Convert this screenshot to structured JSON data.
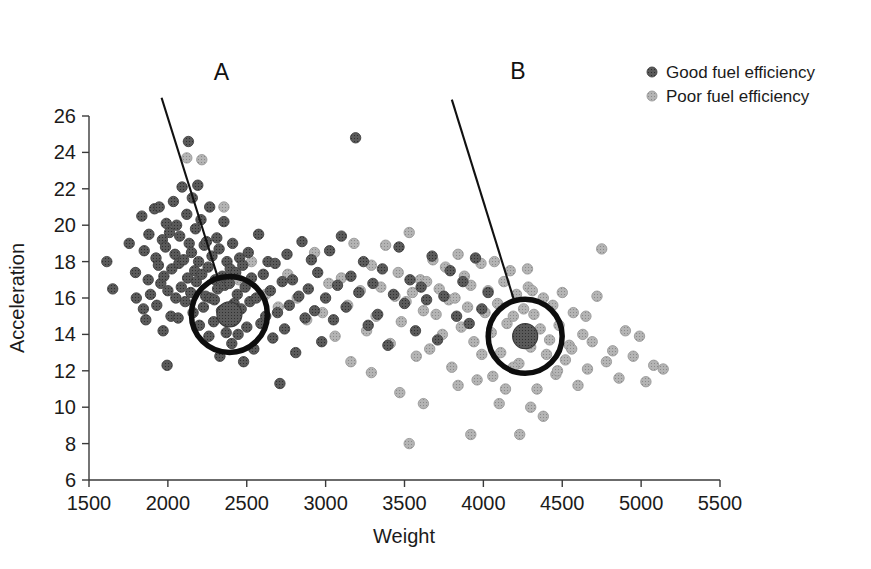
{
  "chart_data": {
    "type": "scatter",
    "title": "",
    "xlabel": "Weight",
    "ylabel": "Acceleration",
    "xlim": [
      1500,
      5500
    ],
    "ylim": [
      6,
      26
    ],
    "xticks": [
      1500,
      2000,
      2500,
      3000,
      3500,
      4000,
      4500,
      5000,
      5500
    ],
    "yticks": [
      6,
      8,
      10,
      12,
      14,
      16,
      18,
      20,
      22,
      24,
      26
    ],
    "grid": false,
    "legend_position": "top-right",
    "legend": [
      {
        "name": "Good fuel efficiency",
        "color": "#565656",
        "marker": "circle"
      },
      {
        "name": "Poor fuel efficiency",
        "color": "#a8a8a8",
        "marker": "circle"
      }
    ],
    "annotations": [
      {
        "label": "A",
        "label_x": 2390,
        "label_y": 28.4,
        "target_x": 2390,
        "target_y": 15.1,
        "circle_radius_px": 38,
        "leader_from_x": 1960,
        "leader_from_y": 27.0,
        "description": "Highlighted cluster centroid in the good fuel efficiency region"
      },
      {
        "label": "B",
        "label_x": 4270,
        "label_y": 28.5,
        "target_x": 4265,
        "target_y": 13.9,
        "circle_radius_px": 37,
        "leader_from_x": 3800,
        "leader_from_y": 26.9,
        "description": "Highlighted cluster centroid in the poor fuel efficiency region"
      }
    ],
    "series": [
      {
        "name": "Good fuel efficiency",
        "color": "#565656",
        "points": [
          [
            1613,
            18.0
          ],
          [
            1650,
            16.5
          ],
          [
            1755,
            19.0
          ],
          [
            1795,
            17.4
          ],
          [
            1800,
            16.0
          ],
          [
            1835,
            20.5
          ],
          [
            1845,
            15.4
          ],
          [
            1850,
            18.6
          ],
          [
            1860,
            14.8
          ],
          [
            1875,
            17.0
          ],
          [
            1880,
            19.5
          ],
          [
            1890,
            16.2
          ],
          [
            1915,
            20.9
          ],
          [
            1925,
            18.2
          ],
          [
            1930,
            15.6
          ],
          [
            1940,
            17.8
          ],
          [
            1945,
            21.0
          ],
          [
            1955,
            16.8
          ],
          [
            1965,
            19.2
          ],
          [
            1970,
            14.2
          ],
          [
            1975,
            17.2
          ],
          [
            1985,
            18.8
          ],
          [
            1990,
            20.1
          ],
          [
            1995,
            12.3
          ],
          [
            2000,
            16.4
          ],
          [
            2010,
            19.6
          ],
          [
            2020,
            15.0
          ],
          [
            2025,
            17.6
          ],
          [
            2035,
            21.3
          ],
          [
            2045,
            18.4
          ],
          [
            2050,
            16.0
          ],
          [
            2055,
            20.0
          ],
          [
            2065,
            14.9
          ],
          [
            2070,
            17.9
          ],
          [
            2075,
            19.4
          ],
          [
            2085,
            16.6
          ],
          [
            2090,
            22.1
          ],
          [
            2100,
            18.1
          ],
          [
            2110,
            15.8
          ],
          [
            2120,
            20.6
          ],
          [
            2125,
            17.1
          ],
          [
            2130,
            24.6
          ],
          [
            2135,
            19.0
          ],
          [
            2145,
            16.3
          ],
          [
            2150,
            18.5
          ],
          [
            2155,
            21.5
          ],
          [
            2160,
            15.2
          ],
          [
            2170,
            17.5
          ],
          [
            2175,
            19.8
          ],
          [
            2180,
            16.9
          ],
          [
            2190,
            22.2
          ],
          [
            2195,
            18.0
          ],
          [
            2200,
            14.5
          ],
          [
            2210,
            20.3
          ],
          [
            2215,
            17.3
          ],
          [
            2225,
            15.5
          ],
          [
            2230,
            18.9
          ],
          [
            2240,
            16.1
          ],
          [
            2245,
            19.1
          ],
          [
            2255,
            17.7
          ],
          [
            2260,
            13.9
          ],
          [
            2265,
            21.0
          ],
          [
            2270,
            16.0
          ],
          [
            2280,
            18.3
          ],
          [
            2290,
            14.7
          ],
          [
            2295,
            15.9
          ],
          [
            2300,
            17.0
          ],
          [
            2310,
            19.3
          ],
          [
            2315,
            16.5
          ],
          [
            2325,
            18.7
          ],
          [
            2330,
            12.8
          ],
          [
            2340,
            15.3
          ],
          [
            2345,
            17.2
          ],
          [
            2355,
            20.2
          ],
          [
            2360,
            16.7
          ],
          [
            2370,
            14.1
          ],
          [
            2375,
            18.0
          ],
          [
            2385,
            15.1
          ],
          [
            2390,
            16.8
          ],
          [
            2395,
            17.6
          ],
          [
            2405,
            13.5
          ],
          [
            2410,
            19.0
          ],
          [
            2420,
            15.7
          ],
          [
            2430,
            17.4
          ],
          [
            2440,
            16.2
          ],
          [
            2445,
            14.0
          ],
          [
            2455,
            18.2
          ],
          [
            2465,
            15.4
          ],
          [
            2475,
            17.8
          ],
          [
            2480,
            12.5
          ],
          [
            2490,
            16.6
          ],
          [
            2500,
            14.4
          ],
          [
            2510,
            18.5
          ],
          [
            2520,
            15.8
          ],
          [
            2530,
            17.1
          ],
          [
            2545,
            13.2
          ],
          [
            2560,
            16.0
          ],
          [
            2575,
            19.5
          ],
          [
            2590,
            14.6
          ],
          [
            2605,
            17.3
          ],
          [
            2620,
            15.0
          ],
          [
            2635,
            18.0
          ],
          [
            2650,
            16.4
          ],
          [
            2665,
            13.8
          ],
          [
            2680,
            17.9
          ],
          [
            2695,
            15.2
          ],
          [
            2710,
            11.3
          ],
          [
            2725,
            16.9
          ],
          [
            2740,
            14.3
          ],
          [
            2755,
            18.4
          ],
          [
            2770,
            15.6
          ],
          [
            2790,
            17.0
          ],
          [
            2810,
            13.0
          ],
          [
            2830,
            16.1
          ],
          [
            2850,
            19.1
          ],
          [
            2870,
            14.9
          ],
          [
            2890,
            16.5
          ],
          [
            2910,
            18.1
          ],
          [
            2930,
            15.3
          ],
          [
            2950,
            17.4
          ],
          [
            2975,
            13.6
          ],
          [
            3000,
            16.0
          ],
          [
            3025,
            18.6
          ],
          [
            3050,
            14.8
          ],
          [
            3075,
            16.7
          ],
          [
            3100,
            19.4
          ],
          [
            3130,
            15.5
          ],
          [
            3160,
            17.2
          ],
          [
            3190,
            24.8
          ],
          [
            3210,
            16.3
          ],
          [
            3240,
            18.0
          ],
          [
            3270,
            14.5
          ],
          [
            3300,
            16.8
          ],
          [
            3330,
            15.1
          ],
          [
            3360,
            17.6
          ],
          [
            3395,
            13.4
          ],
          [
            3430,
            16.2
          ],
          [
            3465,
            18.8
          ],
          [
            3500,
            15.7
          ],
          [
            3535,
            17.0
          ],
          [
            3570,
            14.2
          ],
          [
            3605,
            16.6
          ],
          [
            3640,
            15.9
          ],
          [
            3675,
            18.3
          ],
          [
            3710,
            13.7
          ],
          [
            3750,
            16.1
          ],
          [
            3790,
            17.5
          ],
          [
            3830,
            15.0
          ],
          [
            3870,
            16.9
          ],
          [
            3910,
            14.6
          ],
          [
            3950,
            18.2
          ],
          [
            3990,
            15.4
          ],
          [
            4030,
            16.3
          ]
        ]
      },
      {
        "name": "Poor fuel efficiency",
        "color": "#a8a8a8",
        "points": [
          [
            2120,
            23.7
          ],
          [
            2215,
            23.6
          ],
          [
            2355,
            21.0
          ],
          [
            2450,
            17.0
          ],
          [
            2530,
            18.0
          ],
          [
            2620,
            16.2
          ],
          [
            2700,
            15.5
          ],
          [
            2760,
            17.3
          ],
          [
            2820,
            16.0
          ],
          [
            2880,
            14.8
          ],
          [
            2930,
            18.5
          ],
          [
            2980,
            15.2
          ],
          [
            3020,
            16.8
          ],
          [
            3060,
            13.9
          ],
          [
            3100,
            17.1
          ],
          [
            3140,
            15.6
          ],
          [
            3180,
            19.0
          ],
          [
            3220,
            16.4
          ],
          [
            3260,
            14.2
          ],
          [
            3290,
            17.8
          ],
          [
            3320,
            15.0
          ],
          [
            3350,
            16.6
          ],
          [
            3380,
            18.9
          ],
          [
            3410,
            13.5
          ],
          [
            3440,
            16.1
          ],
          [
            3460,
            17.4
          ],
          [
            3480,
            14.7
          ],
          [
            3510,
            15.8
          ],
          [
            3530,
            19.6
          ],
          [
            3550,
            16.3
          ],
          [
            3575,
            12.8
          ],
          [
            3600,
            17.0
          ],
          [
            3620,
            15.3
          ],
          [
            3640,
            16.9
          ],
          [
            3660,
            13.2
          ],
          [
            3680,
            18.1
          ],
          [
            3700,
            15.1
          ],
          [
            3720,
            16.5
          ],
          [
            3740,
            14.0
          ],
          [
            3760,
            17.7
          ],
          [
            3780,
            15.9
          ],
          [
            3800,
            12.2
          ],
          [
            3820,
            16.0
          ],
          [
            3840,
            18.4
          ],
          [
            3860,
            14.4
          ],
          [
            3880,
            17.2
          ],
          [
            3900,
            15.5
          ],
          [
            3920,
            16.7
          ],
          [
            3940,
            13.6
          ],
          [
            3960,
            11.5
          ],
          [
            3985,
            17.9
          ],
          [
            4010,
            15.2
          ],
          [
            4030,
            16.4
          ],
          [
            4050,
            14.1
          ],
          [
            4070,
            18.0
          ],
          [
            4090,
            15.7
          ],
          [
            4110,
            13.0
          ],
          [
            4130,
            16.9
          ],
          [
            4150,
            14.6
          ],
          [
            4170,
            17.5
          ],
          [
            4190,
            15.0
          ],
          [
            4210,
            16.2
          ],
          [
            4225,
            12.4
          ],
          [
            4240,
            13.8
          ],
          [
            4255,
            15.4
          ],
          [
            4270,
            14.0
          ],
          [
            4285,
            16.6
          ],
          [
            4300,
            13.3
          ],
          [
            4320,
            15.1
          ],
          [
            4340,
            11.0
          ],
          [
            4360,
            14.3
          ],
          [
            4380,
            16.0
          ],
          [
            4400,
            12.9
          ],
          [
            4420,
            13.7
          ],
          [
            4440,
            15.6
          ],
          [
            4460,
            11.8
          ],
          [
            4480,
            14.5
          ],
          [
            4500,
            16.3
          ],
          [
            4520,
            12.6
          ],
          [
            4545,
            13.4
          ],
          [
            4570,
            15.2
          ],
          [
            4600,
            11.2
          ],
          [
            4630,
            14.0
          ],
          [
            4660,
            12.1
          ],
          [
            4690,
            13.6
          ],
          [
            4720,
            16.1
          ],
          [
            4750,
            18.7
          ],
          [
            4780,
            12.5
          ],
          [
            4820,
            13.1
          ],
          [
            4860,
            11.6
          ],
          [
            4900,
            14.2
          ],
          [
            4950,
            12.8
          ],
          [
            4990,
            13.9
          ],
          [
            5030,
            11.4
          ],
          [
            5080,
            12.3
          ],
          [
            5140,
            12.1
          ],
          [
            3530,
            8.0
          ],
          [
            3920,
            8.5
          ],
          [
            4230,
            8.5
          ],
          [
            4380,
            9.5
          ],
          [
            4100,
            10.2
          ],
          [
            4300,
            10.0
          ],
          [
            3620,
            10.2
          ],
          [
            4470,
            12.0
          ],
          [
            3840,
            11.2
          ],
          [
            4140,
            11.0
          ],
          [
            4560,
            13.2
          ],
          [
            4650,
            15.0
          ],
          [
            4280,
            17.6
          ],
          [
            4310,
            16.4
          ],
          [
            4190,
            12.2
          ],
          [
            4060,
            11.7
          ],
          [
            3990,
            12.9
          ],
          [
            3470,
            10.8
          ],
          [
            3290,
            11.9
          ],
          [
            3160,
            12.5
          ]
        ]
      }
    ]
  },
  "geometry": {
    "plot_left_px": 89,
    "plot_right_px": 720,
    "plot_top_px": 116,
    "plot_bottom_px": 480
  }
}
